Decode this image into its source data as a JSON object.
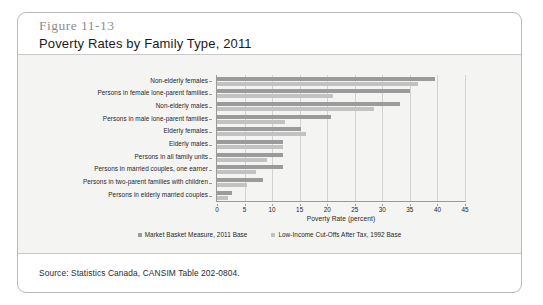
{
  "figure": {
    "number": "Figure 11-13",
    "title": "Poverty Rates by Family Type, 2011",
    "source": "Source: Statistics Canada, CANSIM Table 202-0804."
  },
  "legend": {
    "position": "bottom-center",
    "items": [
      {
        "label": "Market Basket Measure, 2011 Base",
        "color": "#9b9b9b"
      },
      {
        "label": "Low-Income Cut-Offs After Tax, 1992 Base",
        "color": "#c2c2c2"
      }
    ]
  },
  "chart_data": {
    "type": "bar",
    "orientation": "horizontal",
    "title": "Poverty Rates by Family Type, 2011",
    "subtitle": "Figure 11-13",
    "xlabel": "Poverty Rate (percent)",
    "ylabel": "",
    "xlim": [
      0,
      45
    ],
    "xticks": [
      0,
      5,
      10,
      15,
      20,
      25,
      30,
      35,
      40,
      45
    ],
    "grid": true,
    "grid_axis": "x",
    "categories": [
      "Non-elderly females",
      "Persons in female lone-parent families",
      "Non-elderly males",
      "Persons in male lone-parent families",
      "Elderly females",
      "Elderly males",
      "Persons in all family units",
      "Persons in married couples, one earner",
      "Persons in two-parent families with children",
      "Persons in elderly married couples"
    ],
    "series": [
      {
        "name": "Market Basket Measure, 2011 Base",
        "color": "#9b9b9b",
        "values": [
          39.5,
          35.0,
          33.2,
          20.6,
          15.2,
          12.0,
          12.0,
          12.0,
          8.3,
          2.8
        ]
      },
      {
        "name": "Low-Income Cut-Offs After Tax, 1992 Base",
        "color": "#c2c2c2",
        "values": [
          36.5,
          21.0,
          28.5,
          12.3,
          16.2,
          12.0,
          9.0,
          7.0,
          5.5,
          2.0
        ]
      }
    ]
  }
}
